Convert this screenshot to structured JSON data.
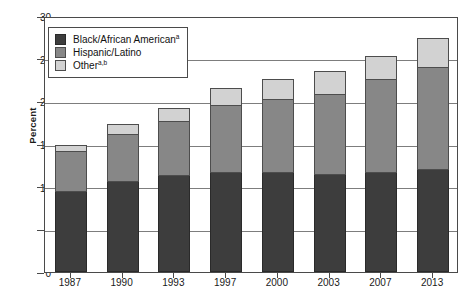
{
  "chart_data": {
    "type": "bar",
    "subtype": "stacked-bar",
    "title": "",
    "xlabel": "",
    "ylabel": "Percent",
    "categories": [
      "1987",
      "1990",
      "1993",
      "1997",
      "2000",
      "2003",
      "2007",
      "2013"
    ],
    "series": [
      {
        "name": "Black/African American",
        "footnote": "a",
        "color": "#3d3d3d",
        "values": [
          9.4,
          10.5,
          11.2,
          11.6,
          11.6,
          11.4,
          11.6,
          11.9
        ]
      },
      {
        "name": "Hispanic/Latino",
        "footnote": "",
        "color": "#878787",
        "values": [
          4.7,
          5.5,
          6.4,
          7.8,
          8.5,
          9.4,
          10.9,
          12.0
        ]
      },
      {
        "name": "Other",
        "footnote": "a,b",
        "color": "#d2d2d2",
        "values": [
          0.7,
          1.2,
          1.5,
          2.1,
          2.4,
          2.6,
          2.7,
          3.4
        ]
      }
    ],
    "totals": [
      14.8,
      17.2,
      19.1,
      21.5,
      22.5,
      23.4,
      25.2,
      27.3
    ],
    "ylim": [
      0,
      30
    ],
    "yticks": [
      0,
      5,
      10,
      15,
      20,
      25,
      30
    ],
    "ytick_labels": [
      "0",
      "5",
      "10",
      "15",
      "20",
      "25",
      "30"
    ],
    "grid": "horizontal",
    "legend_position": "upper-left-inside"
  },
  "axis": {
    "y_title": "Percent"
  },
  "legend": {
    "items": [
      {
        "label": "Black/African American",
        "sup": "a",
        "swatch": "black"
      },
      {
        "label": "Hispanic/Latino",
        "sup": "",
        "swatch": "hispanic"
      },
      {
        "label": "Other",
        "sup": "a,b",
        "swatch": "other"
      }
    ]
  }
}
